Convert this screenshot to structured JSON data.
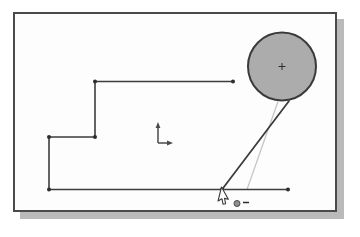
{
  "window": {
    "background_color": "#ffffff"
  },
  "canvas": {
    "x": 13,
    "y": 12,
    "width": 324,
    "height": 200,
    "border_color": "#4a4a4a",
    "background_color": "#fdfdfd",
    "shadow_color": "#bababa",
    "shadow_offset": 7
  },
  "sketch": {
    "styles": {
      "profile": {
        "color": "#3d3d3d",
        "width": 1.6
      },
      "tangent": {
        "color": "#3d3d3d",
        "width": 1.8
      },
      "guide": {
        "color": "#c6c6c6",
        "width": 1.3
      },
      "point_color": "#2d2d2d",
      "point_radius": 2
    },
    "circle": {
      "cx": 282,
      "cy": 66.5,
      "r": 34,
      "fill": "#acacac",
      "stroke": "#3a3a3a",
      "stroke_width": 2,
      "center_mark": "+",
      "center_mark_size": 7,
      "center_mark_color": "#2d2d2d"
    },
    "lines": [
      {
        "name": "top-horizontal-line",
        "type": "profile",
        "x1": 95,
        "y1": 81.5,
        "x2": 233,
        "y2": 81.5
      },
      {
        "name": "upper-step-vertical-line",
        "type": "profile",
        "x1": 95,
        "y1": 81.5,
        "x2": 95,
        "y2": 137
      },
      {
        "name": "middle-horizontal-line",
        "type": "profile",
        "x1": 49,
        "y1": 137,
        "x2": 95,
        "y2": 137
      },
      {
        "name": "left-vertical-line",
        "type": "profile",
        "x1": 49,
        "y1": 137,
        "x2": 49,
        "y2": 189.5
      },
      {
        "name": "bottom-horizontal-line",
        "type": "profile",
        "x1": 49,
        "y1": 189.5,
        "x2": 288,
        "y2": 189.5
      },
      {
        "name": "tangent-line-in-progress",
        "type": "tangent",
        "x1": 222,
        "y1": 189.5,
        "x2": 289,
        "y2": 101
      },
      {
        "name": "guide-line",
        "type": "guide",
        "x1": 247,
        "y1": 189.5,
        "x2": 278,
        "y2": 101.5
      }
    ],
    "points": [
      {
        "x": 95,
        "y": 81.5
      },
      {
        "x": 233,
        "y": 81.5
      },
      {
        "x": 95,
        "y": 137
      },
      {
        "x": 49,
        "y": 137
      },
      {
        "x": 49,
        "y": 189.5
      },
      {
        "x": 222,
        "y": 189.5
      },
      {
        "x": 288,
        "y": 189.5
      }
    ],
    "origin_axes": {
      "x": 158,
      "y": 143,
      "up_length": 21,
      "right_length": 15,
      "color": "#4a4a4a"
    }
  },
  "cursor": {
    "x": 221.5,
    "y": 187,
    "rotation_deg": 14,
    "fill": "#ffffff",
    "outline": "#3a3a3a"
  },
  "snap_indicator": {
    "dot_x": 237,
    "dot_y": 203.5,
    "dot_r": 3,
    "dot_fill": "#8f8f8f",
    "dot_stroke": "#4a4a4a",
    "dash_x1": 243,
    "dash_y1": 202.5,
    "dash_x2": 249,
    "dash_y2": 202.5,
    "dash_color": "#2d2d2d",
    "dash_width": 1.5
  }
}
